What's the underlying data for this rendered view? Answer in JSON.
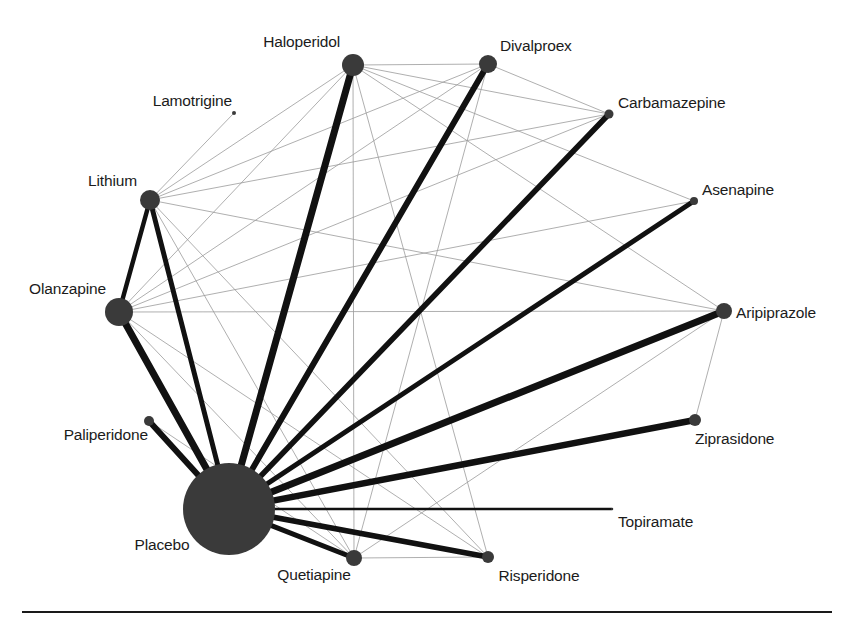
{
  "figure": {
    "type": "network-meta-analysis-graph",
    "width": 854,
    "height": 623,
    "background_color": "#ffffff",
    "node_color": "#3a3a3a",
    "thick_edge_color": "#111111",
    "thin_edge_color": "#9a9a9a",
    "rule_color": "#1a1a1a"
  },
  "chart_data": {
    "type": "scatter",
    "title": "",
    "subtitle": "",
    "xlabel": "",
    "ylabel": "",
    "grid": false,
    "legend": "none",
    "nodes": [
      {
        "id": "haloperidol",
        "label": "Haloperidol",
        "x": 353,
        "y": 65,
        "r": 11,
        "label_pos": "left",
        "label_x": 340,
        "label_y": 42
      },
      {
        "id": "divalproex",
        "label": "Divalproex",
        "x": 488,
        "y": 64,
        "r": 9,
        "label_pos": "right",
        "label_x": 500,
        "label_y": 46
      },
      {
        "id": "carbamazepine",
        "label": "Carbamazepine",
        "x": 609,
        "y": 114,
        "r": 4.5,
        "label_pos": "right",
        "label_x": 618,
        "label_y": 103
      },
      {
        "id": "lamotrigine",
        "label": "Lamotrigine",
        "x": 234,
        "y": 113,
        "r": 2,
        "label_pos": "left",
        "label_x": 232,
        "label_y": 101
      },
      {
        "id": "lithium",
        "label": "Lithium",
        "x": 150,
        "y": 200,
        "r": 10,
        "label_pos": "left",
        "label_x": 137,
        "label_y": 181
      },
      {
        "id": "asenapine",
        "label": "Asenapine",
        "x": 694,
        "y": 201,
        "r": 4,
        "label_pos": "right",
        "label_x": 702,
        "label_y": 190
      },
      {
        "id": "olanzapine",
        "label": "Olanzapine",
        "x": 119,
        "y": 312,
        "r": 14,
        "label_pos": "left",
        "label_x": 106,
        "label_y": 289
      },
      {
        "id": "aripiprazole",
        "label": "Aripiprazole",
        "x": 724,
        "y": 311,
        "r": 8,
        "label_pos": "right",
        "label_x": 736,
        "label_y": 313
      },
      {
        "id": "paliperidone",
        "label": "Paliperidone",
        "x": 149,
        "y": 421,
        "r": 5,
        "label_pos": "left",
        "label_x": 148,
        "label_y": 435
      },
      {
        "id": "ziprasidone",
        "label": "Ziprasidone",
        "x": 695,
        "y": 420,
        "r": 6,
        "label_pos": "right",
        "label_x": 695,
        "label_y": 439
      },
      {
        "id": "placebo",
        "label": "Placebo",
        "x": 229,
        "y": 509,
        "r": 46,
        "label_pos": "center",
        "label_x": 162,
        "label_y": 545
      },
      {
        "id": "topiramate",
        "label": "Topiramate",
        "x": 612,
        "y": 509,
        "r": 1,
        "label_pos": "right",
        "label_x": 618,
        "label_y": 522
      },
      {
        "id": "quetiapine",
        "label": "Quetiapine",
        "x": 354,
        "y": 558,
        "r": 8,
        "label_pos": "center",
        "label_x": 314,
        "label_y": 575
      },
      {
        "id": "risperidone",
        "label": "Risperidone",
        "x": 488,
        "y": 557,
        "r": 6,
        "label_pos": "center",
        "label_x": 539,
        "label_y": 576
      }
    ],
    "edges": [
      {
        "source": "placebo",
        "target": "olanzapine",
        "weight": 7,
        "style": "thick"
      },
      {
        "source": "placebo",
        "target": "paliperidone",
        "weight": 6,
        "style": "thick"
      },
      {
        "source": "placebo",
        "target": "lithium",
        "weight": 5,
        "style": "thick"
      },
      {
        "source": "placebo",
        "target": "haloperidol",
        "weight": 7,
        "style": "thick"
      },
      {
        "source": "placebo",
        "target": "divalproex",
        "weight": 6,
        "style": "thick"
      },
      {
        "source": "placebo",
        "target": "carbamazepine",
        "weight": 5.5,
        "style": "thick"
      },
      {
        "source": "placebo",
        "target": "asenapine",
        "weight": 5,
        "style": "thick"
      },
      {
        "source": "placebo",
        "target": "aripiprazole",
        "weight": 7,
        "style": "thick"
      },
      {
        "source": "placebo",
        "target": "ziprasidone",
        "weight": 6.5,
        "style": "thick"
      },
      {
        "source": "placebo",
        "target": "topiramate",
        "weight": 2.5,
        "style": "thick"
      },
      {
        "source": "placebo",
        "target": "risperidone",
        "weight": 5.5,
        "style": "thick"
      },
      {
        "source": "placebo",
        "target": "quetiapine",
        "weight": 5,
        "style": "thick"
      },
      {
        "source": "lithium",
        "target": "olanzapine",
        "weight": 4.5,
        "style": "thick"
      },
      {
        "source": "lithium",
        "target": "lamotrigine",
        "weight": 1,
        "style": "thin"
      },
      {
        "source": "lithium",
        "target": "divalproex",
        "weight": 1,
        "style": "thin"
      },
      {
        "source": "lithium",
        "target": "haloperidol",
        "weight": 1,
        "style": "thin"
      },
      {
        "source": "lithium",
        "target": "carbamazepine",
        "weight": 1,
        "style": "thin"
      },
      {
        "source": "lithium",
        "target": "quetiapine",
        "weight": 1,
        "style": "thin"
      },
      {
        "source": "lithium",
        "target": "risperidone",
        "weight": 1,
        "style": "thin"
      },
      {
        "source": "lithium",
        "target": "aripiprazole",
        "weight": 1,
        "style": "thin"
      },
      {
        "source": "olanzapine",
        "target": "haloperidol",
        "weight": 1,
        "style": "thin"
      },
      {
        "source": "olanzapine",
        "target": "divalproex",
        "weight": 1,
        "style": "thin"
      },
      {
        "source": "olanzapine",
        "target": "carbamazepine",
        "weight": 1,
        "style": "thin"
      },
      {
        "source": "olanzapine",
        "target": "asenapine",
        "weight": 1,
        "style": "thin"
      },
      {
        "source": "olanzapine",
        "target": "aripiprazole",
        "weight": 1,
        "style": "thin"
      },
      {
        "source": "olanzapine",
        "target": "risperidone",
        "weight": 1,
        "style": "thin"
      },
      {
        "source": "olanzapine",
        "target": "quetiapine",
        "weight": 1,
        "style": "thin"
      },
      {
        "source": "haloperidol",
        "target": "divalproex",
        "weight": 1,
        "style": "thin"
      },
      {
        "source": "haloperidol",
        "target": "carbamazepine",
        "weight": 1,
        "style": "thin"
      },
      {
        "source": "haloperidol",
        "target": "asenapine",
        "weight": 1,
        "style": "thin"
      },
      {
        "source": "haloperidol",
        "target": "aripiprazole",
        "weight": 1,
        "style": "thin"
      },
      {
        "source": "haloperidol",
        "target": "quetiapine",
        "weight": 1,
        "style": "thin"
      },
      {
        "source": "haloperidol",
        "target": "risperidone",
        "weight": 1,
        "style": "thin"
      },
      {
        "source": "divalproex",
        "target": "carbamazepine",
        "weight": 1,
        "style": "thin"
      },
      {
        "source": "divalproex",
        "target": "quetiapine",
        "weight": 1,
        "style": "thin"
      },
      {
        "source": "aripiprazole",
        "target": "ziprasidone",
        "weight": 1,
        "style": "thin"
      },
      {
        "source": "paliperidone",
        "target": "quetiapine",
        "weight": 1,
        "style": "thin"
      },
      {
        "source": "quetiapine",
        "target": "risperidone",
        "weight": 1,
        "style": "thin"
      },
      {
        "source": "quetiapine",
        "target": "aripiprazole",
        "weight": 1,
        "style": "thin"
      }
    ],
    "rule": {
      "x1": 22,
      "x2": 832,
      "y": 612
    }
  }
}
